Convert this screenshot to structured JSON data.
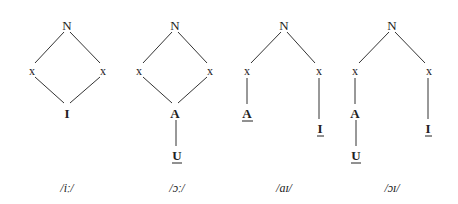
{
  "diagram": {
    "trees": [
      {
        "label": "/iː/",
        "root": "N",
        "skeleton": [
          "x",
          "x"
        ],
        "elements": [
          {
            "text": "I",
            "underline": false,
            "attached_to": "both"
          }
        ]
      },
      {
        "label": "/ɔː/",
        "root": "N",
        "skeleton": [
          "x",
          "x"
        ],
        "elements": [
          {
            "text": "A",
            "underline": false,
            "attached_to": "both"
          },
          {
            "text": "U",
            "underline": true,
            "attached_to": "A"
          }
        ]
      },
      {
        "label": "/aɪ/",
        "root": "N",
        "skeleton": [
          "x",
          "x"
        ],
        "elements": [
          {
            "text": "A",
            "underline": true,
            "attached_to": "left-x"
          },
          {
            "text": "I",
            "underline": true,
            "attached_to": "right-x"
          }
        ]
      },
      {
        "label": "/ɔɪ/",
        "root": "N",
        "skeleton": [
          "x",
          "x"
        ],
        "elements": [
          {
            "text": "A",
            "underline": false,
            "attached_to": "left-x"
          },
          {
            "text": "U",
            "underline": true,
            "attached_to": "A"
          },
          {
            "text": "I",
            "underline": true,
            "attached_to": "right-x"
          }
        ]
      }
    ],
    "t": {
      "N": "N",
      "x": "x",
      "I": "I",
      "A": "A",
      "U": "U",
      "l1": "/iː/",
      "l2": "/ɔː/",
      "l3": "/aɪ/",
      "l4": "/ɔɪ/"
    }
  }
}
